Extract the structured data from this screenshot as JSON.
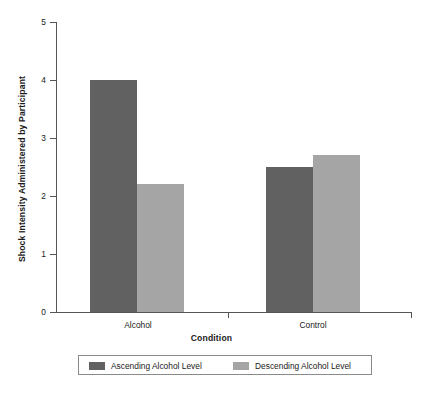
{
  "chart_data": {
    "type": "bar",
    "title": "",
    "xlabel": "Condition",
    "ylabel": "Shock Intensity Administered by Participant",
    "categories": [
      "Alcohol",
      "Control"
    ],
    "series": [
      {
        "name": "Ascending Alcohol Level",
        "color": "#616161",
        "values": [
          4.0,
          2.5
        ]
      },
      {
        "name": "Descending Alcohol Level",
        "color": "#a5a5a5",
        "values": [
          2.2,
          2.7
        ]
      }
    ],
    "ylim": [
      0,
      5
    ],
    "yticks": [
      0,
      1,
      2,
      3,
      4,
      5
    ],
    "ytick_labels": [
      "0",
      "1",
      "2",
      "3",
      "4",
      "5"
    ],
    "grid": false,
    "legend_position": "bottom"
  },
  "axes": {
    "y_title": "Shock Intensity Administered by Participant",
    "x_title": "Condition",
    "y_tick_labels": [
      "5",
      "4",
      "3",
      "2",
      "1",
      "0"
    ],
    "x_tick_labels": [
      "Alcohol",
      "Control"
    ]
  },
  "legend": {
    "items": [
      {
        "label": "Ascending Alcohol Level",
        "color": "#616161"
      },
      {
        "label": "Descending Alcohol Level",
        "color": "#a5a5a5"
      }
    ]
  },
  "colors": {
    "ascending": "#616161",
    "descending": "#a5a5a5",
    "axis": "#555555",
    "text": "#1a1a1a",
    "background": "#ffffff"
  },
  "caption": ""
}
